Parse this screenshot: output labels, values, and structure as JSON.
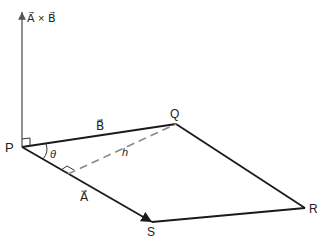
{
  "diagram": {
    "axis_label": "A⃗ × B⃗",
    "points": {
      "P": {
        "label": "P",
        "x": 22,
        "y": 147
      },
      "Q": {
        "label": "Q",
        "x": 176,
        "y": 124
      },
      "R": {
        "label": "R",
        "x": 305,
        "y": 208
      },
      "S": {
        "label": "S",
        "x": 152,
        "y": 222
      }
    },
    "vector_labels": {
      "A": "A⃗",
      "B": "B⃗"
    },
    "angle_label": "θ",
    "height_label": "h",
    "colors": {
      "line": "#1a1a1a",
      "axis": "#555555",
      "dashed": "#888888"
    }
  }
}
